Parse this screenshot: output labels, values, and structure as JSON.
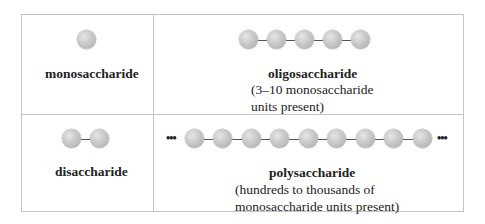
{
  "cells": {
    "monosaccharide": {
      "name": "monosaccharide",
      "units_drawn": 1
    },
    "oligosaccharide": {
      "name": "oligosaccharide",
      "desc_line1": "(3–10 monosaccharide",
      "desc_line2": "units present)",
      "units_drawn": 5
    },
    "disaccharide": {
      "name": "disaccharide",
      "units_drawn": 2
    },
    "polysaccharide": {
      "name": "polysaccharide",
      "desc_line1": "(hundreds to thousands of",
      "desc_line2": "monosaccharide units present)",
      "units_drawn": 9,
      "ellipsis_left": "•••",
      "ellipsis_right": "•••"
    }
  },
  "colors": {
    "border": "#c4c4c4",
    "sphere": "#c8c8c8",
    "bond": "#555555"
  }
}
